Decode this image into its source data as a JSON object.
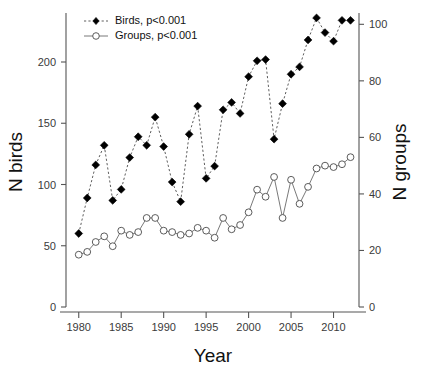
{
  "chart_data": {
    "type": "line",
    "title": "",
    "xlabel": "Year",
    "ylabel": "N birds",
    "y2label": "N groups",
    "grid": false,
    "legend_position": "top-left",
    "xlim": [
      1978.5,
      2013
    ],
    "xticks": [
      1980,
      1985,
      1990,
      1995,
      2000,
      2005,
      2010
    ],
    "ylim": [
      0,
      240
    ],
    "yticks": [
      0,
      50,
      100,
      150,
      200
    ],
    "y2lim": [
      0,
      104
    ],
    "y2ticks": [
      0,
      20,
      40,
      60,
      80,
      100
    ],
    "x": [
      1980,
      1981,
      1982,
      1983,
      1984,
      1985,
      1986,
      1987,
      1988,
      1989,
      1990,
      1991,
      1992,
      1993,
      1994,
      1995,
      1996,
      1997,
      1998,
      1999,
      2000,
      2001,
      2002,
      2003,
      2004,
      2005,
      2006,
      2007,
      2008,
      2009,
      2010,
      2011,
      2012
    ],
    "series": [
      {
        "name": "Birds, p<0.001",
        "axis": "left",
        "marker": "filled-diamond",
        "linestyle": "dashed",
        "color": "#000000",
        "values": [
          60,
          89,
          116,
          132,
          87,
          96,
          122,
          139,
          132,
          155,
          131,
          102,
          86,
          141,
          164,
          105,
          115,
          161,
          167,
          158,
          188,
          201,
          202,
          137,
          166,
          190,
          196,
          218,
          236,
          224,
          217,
          234,
          234
        ]
      },
      {
        "name": "Groups, p<0.001",
        "axis": "right",
        "marker": "open-circle",
        "linestyle": "solid",
        "color": "#4a4a4a",
        "values": [
          18.5,
          19.5,
          23,
          25,
          21.5,
          27,
          25.5,
          26.5,
          31.5,
          31.5,
          27,
          26.5,
          25.5,
          26,
          28,
          27,
          24.5,
          31.5,
          27.5,
          29,
          33.5,
          41.5,
          39,
          46,
          31.5,
          45,
          36.5,
          42.5,
          49,
          50,
          49.5,
          50.5,
          53
        ]
      }
    ],
    "legend": [
      {
        "label": "Birds, p<0.001"
      },
      {
        "label": "Groups, p<0.001"
      }
    ]
  },
  "tick_labels": {
    "y_left": [
      "0",
      "50",
      "100",
      "150",
      "200"
    ],
    "y_right": [
      "0",
      "20",
      "40",
      "60",
      "80",
      "100"
    ],
    "x_bottom": [
      "1980",
      "1985",
      "1990",
      "1995",
      "2000",
      "2005",
      "2010"
    ]
  },
  "labels": {
    "x_axis_title": "Year",
    "y_left_axis_title": "N birds",
    "y_right_axis_title": "N groups"
  }
}
